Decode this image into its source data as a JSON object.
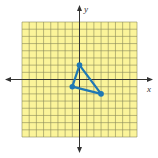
{
  "figure": {
    "type": "coordinate-plane",
    "x_axis_label": "x",
    "y_axis_label": "y",
    "grid_range": {
      "xmin": -8,
      "xmax": 8,
      "ymin": -8,
      "ymax": 8
    },
    "colors": {
      "grid_fill": "#fbf49a",
      "grid_lines": "#8a8a5a",
      "axis": "#333333",
      "triangle": "#1f78b4"
    }
  },
  "shape": {
    "type": "triangle",
    "vertices": [
      {
        "x": 0,
        "y": 2
      },
      {
        "x": -1,
        "y": -1
      },
      {
        "x": 3,
        "y": -2
      }
    ]
  }
}
